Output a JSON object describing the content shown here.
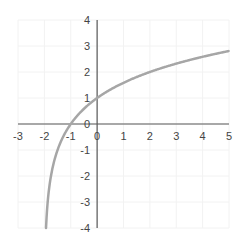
{
  "chart_data": {
    "type": "line",
    "title": "",
    "function": "y = log2(x + 2)",
    "xlabel": "",
    "ylabel": "",
    "xlim": [
      -3,
      5
    ],
    "ylim": [
      -4,
      4
    ],
    "grid": true,
    "x_ticks": [
      "-3",
      "-2",
      "-1",
      "0",
      "1",
      "2",
      "3",
      "4",
      "5"
    ],
    "y_ticks": [
      "4",
      "3",
      "2",
      "1",
      "0",
      "-1",
      "-2",
      "-3",
      "-4"
    ],
    "series": [
      {
        "name": "curve",
        "color": "#a6a6a6",
        "x": [
          -1.9375,
          -1.875,
          -1.75,
          -1.5,
          -1,
          0,
          1,
          2,
          3,
          4,
          5
        ],
        "y": [
          -4,
          -3,
          -2,
          -1,
          0,
          1,
          1.585,
          2,
          2.322,
          2.585,
          2.807
        ]
      }
    ],
    "colors": {
      "axis": "#595959",
      "grid": "#f2f2f2",
      "curve": "#a6a6a6"
    }
  }
}
